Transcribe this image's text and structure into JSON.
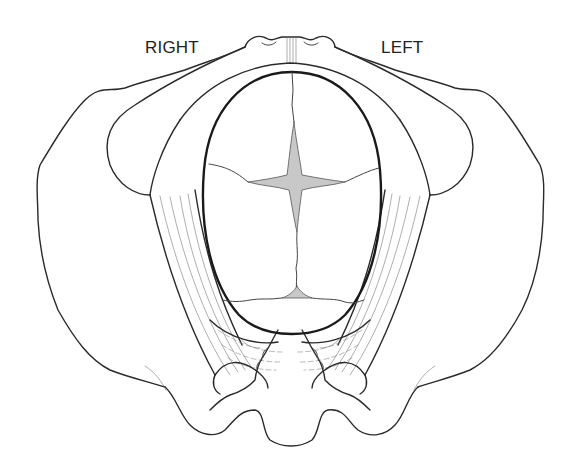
{
  "diagram": {
    "labels": {
      "right": "RIGHT",
      "left": "LEFT"
    },
    "structures": [
      "pelvis-outline",
      "pubic-symphysis",
      "ischial-spines",
      "sacrospinous-ligaments",
      "sacrotuberous-ligaments",
      "sacrum",
      "coccyx",
      "fetal-skull",
      "sagittal-suture",
      "coronal-suture",
      "lambdoid-suture",
      "anterior-fontanelle",
      "posterior-fontanelle"
    ],
    "colors": {
      "line": "#2a2a2a",
      "fontanelle_fill": "#c8c8c8",
      "background": "#ffffff"
    }
  }
}
